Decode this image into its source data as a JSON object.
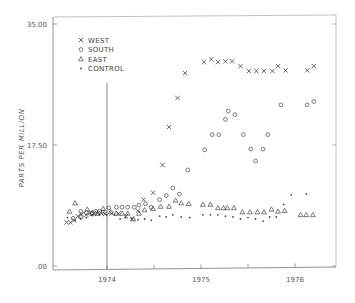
{
  "chart_data": {
    "type": "scatter",
    "title": "",
    "xlabel": "",
    "ylabel": "PARTS PER MILLION",
    "ylim": [
      0,
      35
    ],
    "xlim": [
      1973.45,
      1976.4
    ],
    "y_ticks": [
      {
        "value": 0,
        "label": ".00"
      },
      {
        "value": 17.5,
        "label": "17.50"
      },
      {
        "value": 35,
        "label": "35.00"
      }
    ],
    "x_ticks": [
      {
        "value": 1974.0,
        "label": "1974"
      },
      {
        "value": 1974.5,
        "label": ""
      },
      {
        "value": 1975.0,
        "label": "1975"
      },
      {
        "value": 1975.5,
        "label": ""
      },
      {
        "value": 1976.0,
        "label": "1976"
      }
    ],
    "reference_line": {
      "x": 1974.0,
      "y_from": 0,
      "y_to": 26.5
    },
    "grid": false,
    "legend_position": "upper-left",
    "series": [
      {
        "name": "WEST",
        "marker": "x",
        "points": [
          [
            1973.57,
            6.3
          ],
          [
            1973.61,
            6.3
          ],
          [
            1973.65,
            6.6
          ],
          [
            1973.69,
            7.2
          ],
          [
            1973.73,
            7.5
          ],
          [
            1973.78,
            7.4
          ],
          [
            1973.82,
            7.7
          ],
          [
            1973.86,
            7.6
          ],
          [
            1973.9,
            7.6
          ],
          [
            1973.94,
            7.6
          ],
          [
            1973.98,
            7.5
          ],
          [
            1974.05,
            7.6
          ],
          [
            1974.12,
            7.6
          ],
          [
            1974.2,
            7.2
          ],
          [
            1974.27,
            6.8
          ],
          [
            1974.33,
            8.0
          ],
          [
            1974.39,
            9.6
          ],
          [
            1974.49,
            10.6
          ],
          [
            1974.59,
            14.6
          ],
          [
            1974.66,
            20.1
          ],
          [
            1974.75,
            24.3
          ],
          [
            1974.83,
            27.9
          ],
          [
            1975.03,
            29.5
          ],
          [
            1975.11,
            29.9
          ],
          [
            1975.18,
            29.5
          ],
          [
            1975.26,
            29.6
          ],
          [
            1975.33,
            29.6
          ],
          [
            1975.42,
            28.9
          ],
          [
            1975.51,
            28.2
          ],
          [
            1975.59,
            28.2
          ],
          [
            1975.67,
            28.2
          ],
          [
            1975.76,
            28.2
          ],
          [
            1975.82,
            28.9
          ],
          [
            1975.9,
            28.3
          ],
          [
            1976.13,
            28.3
          ],
          [
            1976.2,
            28.9
          ]
        ]
      },
      {
        "name": "SOUTH",
        "marker": "circle",
        "points": [
          [
            1973.64,
            6.9
          ],
          [
            1973.72,
            7.9
          ],
          [
            1973.78,
            7.7
          ],
          [
            1973.84,
            7.7
          ],
          [
            1973.88,
            7.9
          ],
          [
            1973.92,
            7.9
          ],
          [
            1973.96,
            7.8
          ],
          [
            1974.02,
            8.4
          ],
          [
            1974.1,
            8.5
          ],
          [
            1974.16,
            8.5
          ],
          [
            1974.22,
            8.5
          ],
          [
            1974.29,
            8.5
          ],
          [
            1974.34,
            8.8
          ],
          [
            1974.41,
            9.0
          ],
          [
            1974.47,
            8.5
          ],
          [
            1974.56,
            9.6
          ],
          [
            1974.63,
            10.2
          ],
          [
            1974.7,
            11.3
          ],
          [
            1974.77,
            10.4
          ],
          [
            1974.86,
            13.9
          ],
          [
            1975.04,
            16.8
          ],
          [
            1975.12,
            19.0
          ],
          [
            1975.19,
            19.0
          ],
          [
            1975.26,
            21.2
          ],
          [
            1975.29,
            22.4
          ],
          [
            1975.36,
            21.9
          ],
          [
            1975.45,
            19.0
          ],
          [
            1975.53,
            16.9
          ],
          [
            1975.58,
            15.2
          ],
          [
            1975.66,
            16.9
          ],
          [
            1975.71,
            19.0
          ],
          [
            1975.85,
            23.3
          ],
          [
            1976.13,
            23.3
          ],
          [
            1976.2,
            23.8
          ]
        ]
      },
      {
        "name": "EAST",
        "marker": "triangle",
        "points": [
          [
            1973.6,
            7.9
          ],
          [
            1973.66,
            9.1
          ],
          [
            1973.72,
            7.2
          ],
          [
            1973.79,
            8.2
          ],
          [
            1973.84,
            7.6
          ],
          [
            1973.9,
            7.6
          ],
          [
            1973.96,
            8.3
          ],
          [
            1974.04,
            7.8
          ],
          [
            1974.1,
            7.6
          ],
          [
            1974.16,
            7.6
          ],
          [
            1974.22,
            7.6
          ],
          [
            1974.28,
            6.8
          ],
          [
            1974.34,
            7.6
          ],
          [
            1974.4,
            8.1
          ],
          [
            1974.49,
            8.3
          ],
          [
            1974.57,
            8.6
          ],
          [
            1974.66,
            8.6
          ],
          [
            1974.73,
            9.5
          ],
          [
            1974.79,
            9.1
          ],
          [
            1974.87,
            9.0
          ],
          [
            1975.02,
            8.9
          ],
          [
            1975.1,
            8.9
          ],
          [
            1975.18,
            8.4
          ],
          [
            1975.24,
            8.4
          ],
          [
            1975.28,
            8.4
          ],
          [
            1975.35,
            8.4
          ],
          [
            1975.44,
            7.8
          ],
          [
            1975.52,
            7.8
          ],
          [
            1975.6,
            7.8
          ],
          [
            1975.67,
            7.8
          ],
          [
            1975.75,
            8.2
          ],
          [
            1975.82,
            7.9
          ],
          [
            1975.89,
            8.0
          ],
          [
            1976.06,
            7.4
          ],
          [
            1976.12,
            7.4
          ],
          [
            1976.19,
            7.4
          ]
        ]
      },
      {
        "name": "CONTROL",
        "marker": "dot",
        "points": [
          [
            1973.58,
            7.0
          ],
          [
            1973.66,
            6.6
          ],
          [
            1973.72,
            6.8
          ],
          [
            1973.78,
            7.0
          ],
          [
            1973.84,
            7.3
          ],
          [
            1973.92,
            7.4
          ],
          [
            1974.0,
            7.4
          ],
          [
            1974.08,
            7.4
          ],
          [
            1974.14,
            6.8
          ],
          [
            1974.2,
            7.0
          ],
          [
            1974.26,
            6.9
          ],
          [
            1974.33,
            6.7
          ],
          [
            1974.4,
            6.8
          ],
          [
            1974.47,
            6.6
          ],
          [
            1974.56,
            7.2
          ],
          [
            1974.63,
            7.1
          ],
          [
            1974.7,
            7.4
          ],
          [
            1974.79,
            7.1
          ],
          [
            1974.88,
            7.0
          ],
          [
            1975.02,
            7.4
          ],
          [
            1975.1,
            7.4
          ],
          [
            1975.18,
            7.4
          ],
          [
            1975.26,
            7.2
          ],
          [
            1975.34,
            7.1
          ],
          [
            1975.42,
            6.8
          ],
          [
            1975.5,
            7.0
          ],
          [
            1975.58,
            6.8
          ],
          [
            1975.66,
            6.5
          ],
          [
            1975.73,
            7.1
          ],
          [
            1975.8,
            7.1
          ],
          [
            1975.88,
            8.9
          ],
          [
            1975.96,
            10.3
          ],
          [
            1976.12,
            10.4
          ]
        ]
      }
    ]
  },
  "legend": {
    "items": [
      {
        "symbol": "×",
        "label": "WEST"
      },
      {
        "symbol": "○",
        "label": "SOUTH"
      },
      {
        "symbol": "△",
        "label": "EAST"
      },
      {
        "symbol": "•",
        "label": "CONTROL"
      }
    ]
  },
  "axes": {
    "y_label": "PARTS PER MILLION",
    "y_tick_labels": [
      "35.00",
      "17.50",
      ".00"
    ],
    "x_tick_labels": [
      "1974",
      "1975",
      "1976"
    ]
  }
}
